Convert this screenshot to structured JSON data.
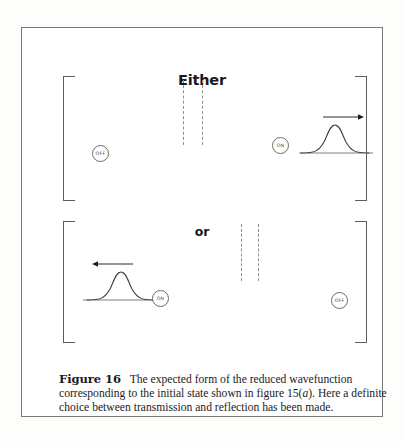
{
  "figure": {
    "either_label": "Either",
    "or_label": "or",
    "panels": [
      {
        "name": "either-panel",
        "detectors": [
          {
            "position": "left",
            "state": "OFF"
          },
          {
            "position": "right",
            "state": "ON"
          }
        ],
        "barrier": {
          "slit_count": 2,
          "style": "dashed"
        },
        "wave_packet": {
          "shape": "gaussian",
          "side": "right",
          "arrow_direction": "right",
          "meaning": "transmitted"
        }
      },
      {
        "name": "or-panel",
        "detectors": [
          {
            "position": "left",
            "state": "ON"
          },
          {
            "position": "right",
            "state": "OFF"
          }
        ],
        "barrier": {
          "slit_count": 2,
          "style": "dashed"
        },
        "wave_packet": {
          "shape": "gaussian",
          "side": "left",
          "arrow_direction": "left",
          "meaning": "reflected"
        }
      }
    ]
  },
  "caption": {
    "label": "Figure 16",
    "text_part_1": "The expected form of the reduced wavefunction corresponding to the initial state shown in figure 15(",
    "italic_token": "a",
    "text_part_2": "). Here a definite choice between transmission and reflection has been made."
  },
  "colors": {
    "page_background": "#fdfdfc",
    "frame_background": "#ffffff",
    "frame_border": "#7a7a78",
    "ink": "#18181a",
    "line": "#5d5d5c",
    "dashed_line": "#8e8e8d",
    "detector_text": "#4a4a49"
  }
}
